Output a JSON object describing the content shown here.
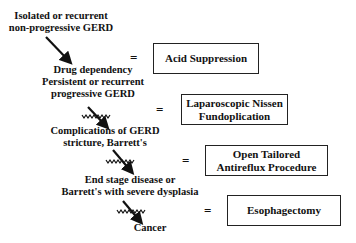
{
  "diagram": {
    "stages": [
      {
        "lines": [
          "Isolated or recurrent",
          "non-progressive GERD"
        ]
      },
      {
        "lines": [
          "Drug dependency",
          "Persistent or recurrent",
          "progressive GERD"
        ]
      },
      {
        "lines": [
          "Complications of GERD",
          "stricture, Barrett's"
        ]
      },
      {
        "lines": [
          "End stage disease or",
          "Barrett's with severe dysplasia"
        ]
      },
      {
        "lines": [
          "Cancer"
        ]
      }
    ],
    "equals": "=",
    "treatments": [
      {
        "lines": [
          "Acid Suppression"
        ]
      },
      {
        "lines": [
          "Laparoscopic Nissen",
          "Fundoplication"
        ]
      },
      {
        "lines": [
          "Open Tailored",
          "Antireflux Procedure"
        ]
      },
      {
        "lines": [
          "Esophagectomy"
        ]
      }
    ],
    "arrow_types": [
      "plain-arrow",
      "blocked-arrow",
      "blocked-arrow",
      "blocked-arrow"
    ]
  }
}
